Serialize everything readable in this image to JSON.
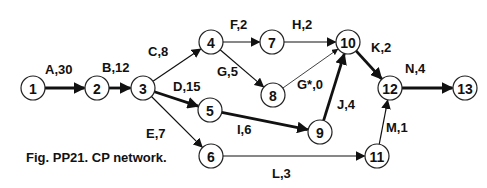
{
  "figure": {
    "caption": "Fig. PP21.  CP network.",
    "type": "critical-path activity-on-arrow network"
  },
  "colors": {
    "line": "#111111",
    "node_fill": "#ffffff",
    "text": "#111111"
  },
  "nodes": [
    {
      "id": "1",
      "x": 33,
      "y": 88
    },
    {
      "id": "2",
      "x": 97,
      "y": 88
    },
    {
      "id": "3",
      "x": 143,
      "y": 88
    },
    {
      "id": "4",
      "x": 211,
      "y": 42
    },
    {
      "id": "5",
      "x": 210,
      "y": 110
    },
    {
      "id": "6",
      "x": 211,
      "y": 156
    },
    {
      "id": "7",
      "x": 272,
      "y": 42
    },
    {
      "id": "8",
      "x": 273,
      "y": 95
    },
    {
      "id": "9",
      "x": 320,
      "y": 132
    },
    {
      "id": "10",
      "x": 348,
      "y": 42
    },
    {
      "id": "11",
      "x": 377,
      "y": 156
    },
    {
      "id": "12",
      "x": 390,
      "y": 88
    },
    {
      "id": "13",
      "x": 465,
      "y": 88
    }
  ],
  "edges": [
    {
      "label": "A,30",
      "from": "1",
      "to": "2",
      "critical": true,
      "lx": 45,
      "ly": 74
    },
    {
      "label": "B,12",
      "from": "2",
      "to": "3",
      "critical": true,
      "lx": 102,
      "ly": 72
    },
    {
      "label": "C,8",
      "from": "3",
      "to": "4",
      "critical": false,
      "lx": 148,
      "ly": 56
    },
    {
      "label": "D,15",
      "from": "3",
      "to": "5",
      "critical": true,
      "lx": 173,
      "ly": 91
    },
    {
      "label": "E,7",
      "from": "3",
      "to": "6",
      "critical": false,
      "lx": 146,
      "ly": 138
    },
    {
      "label": "F,2",
      "from": "4",
      "to": "7",
      "critical": false,
      "lx": 230,
      "ly": 29
    },
    {
      "label": "G,5",
      "from": "4",
      "to": "8",
      "critical": false,
      "lx": 217,
      "ly": 76
    },
    {
      "label": "H,2",
      "from": "7",
      "to": "10",
      "critical": false,
      "lx": 292,
      "ly": 29
    },
    {
      "label": "G*,0",
      "from": "8",
      "to": "10",
      "critical": false,
      "dummy": true,
      "lx": 297,
      "ly": 89
    },
    {
      "label": "I,6",
      "from": "5",
      "to": "9",
      "critical": true,
      "lx": 237,
      "ly": 134
    },
    {
      "label": "J,4",
      "from": "9",
      "to": "10",
      "critical": true,
      "lx": 337,
      "ly": 109
    },
    {
      "label": "K,2",
      "from": "10",
      "to": "12",
      "critical": true,
      "lx": 371,
      "ly": 52
    },
    {
      "label": "L,3",
      "from": "6",
      "to": "11",
      "critical": false,
      "lx": 272,
      "ly": 178
    },
    {
      "label": "M,1",
      "from": "11",
      "to": "12",
      "critical": false,
      "lx": 386,
      "ly": 132
    },
    {
      "label": "N,4",
      "from": "12",
      "to": "13",
      "critical": true,
      "lx": 405,
      "ly": 73
    }
  ]
}
